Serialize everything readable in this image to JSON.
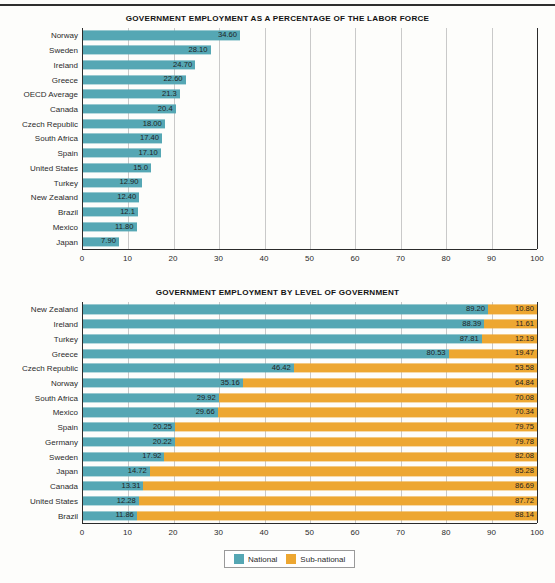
{
  "chart_data": [
    {
      "type": "bar",
      "title": "GOVERNMENT EMPLOYMENT AS A PERCENTAGE OF THE LABOR FORCE",
      "orientation": "horizontal",
      "xlabel": "",
      "ylabel": "",
      "xlim": [
        0,
        100
      ],
      "xticks": [
        "0",
        "10",
        "20",
        "30",
        "40",
        "50",
        "60",
        "70",
        "80",
        "90",
        "100"
      ],
      "grid": true,
      "legend": null,
      "series_color": "#55a7b4",
      "categories": [
        "Norway",
        "Sweden",
        "Ireland",
        "Greece",
        "OECD Average",
        "Canada",
        "Czech Republic",
        "South Africa",
        "Spain",
        "United States",
        "Turkey",
        "New Zealand",
        "Brazil",
        "Mexico",
        "Japan"
      ],
      "values": [
        34.6,
        28.1,
        24.7,
        22.6,
        21.3,
        20.4,
        18.0,
        17.4,
        17.1,
        15.0,
        12.9,
        12.4,
        12.1,
        11.8,
        7.9
      ],
      "labels": [
        "34.60",
        "28.10",
        "24.70",
        "22.60",
        "21.3",
        "20.4",
        "18.00",
        "17.40",
        "17.10",
        "15.0",
        "12.90",
        "12.40",
        "12.1",
        "11.80",
        "7.90"
      ]
    },
    {
      "type": "bar",
      "title": "GOVERNMENT EMPLOYMENT BY LEVEL OF GOVERNMENT",
      "orientation": "horizontal",
      "stacked": true,
      "xlabel": "",
      "ylabel": "",
      "xlim": [
        0,
        100
      ],
      "xticks": [
        "0",
        "10",
        "20",
        "30",
        "40",
        "50",
        "60",
        "70",
        "80",
        "90",
        "100"
      ],
      "grid": true,
      "legend_position": "bottom",
      "categories": [
        "New Zealand",
        "Ireland",
        "Turkey",
        "Greece",
        "Czech Republic",
        "Norway",
        "South Africa",
        "Mexico",
        "Spain",
        "Germany",
        "Sweden",
        "Japan",
        "Canada",
        "United States",
        "Brazil"
      ],
      "series": [
        {
          "name": "National",
          "color": "#55a7b4",
          "values": [
            89.2,
            88.39,
            87.81,
            80.53,
            46.42,
            35.16,
            29.92,
            29.66,
            20.25,
            20.22,
            17.92,
            14.72,
            13.31,
            12.28,
            11.86
          ],
          "labels": [
            "89.20",
            "88.39",
            "87.81",
            "80.53",
            "46.42",
            "35.16",
            "29.92",
            "29.66",
            "20.25",
            "20.22",
            "17.92",
            "14.72",
            "13.31",
            "12.28",
            "11.86"
          ]
        },
        {
          "name": "Sub-national",
          "color": "#eda732",
          "values": [
            10.8,
            11.61,
            12.19,
            19.47,
            53.58,
            64.84,
            70.08,
            70.34,
            79.75,
            79.78,
            82.08,
            85.28,
            86.69,
            87.72,
            88.14
          ],
          "labels": [
            "10.80",
            "11.61",
            "12.19",
            "19.47",
            "53.58",
            "64.84",
            "70.08",
            "70.34",
            "79.75",
            "79.78",
            "82.08",
            "85.28",
            "86.69",
            "87.72",
            "88.14"
          ]
        }
      ]
    }
  ],
  "charts": {
    "top": {
      "title": "GOVERNMENT EMPLOYMENT AS A PERCENTAGE OF THE LABOR FORCE"
    },
    "bottom": {
      "title": "GOVERNMENT EMPLOYMENT BY LEVEL OF GOVERNMENT",
      "legend": [
        {
          "label": "National",
          "color": "#55a7b4"
        },
        {
          "label": "Sub-national",
          "color": "#eda732"
        }
      ]
    }
  },
  "colors": {
    "national": "#55a7b4",
    "sub_national": "#eda732",
    "axis": "#2b2b2b",
    "grid": "#c9c9c9",
    "background": "#fdfdfb"
  }
}
